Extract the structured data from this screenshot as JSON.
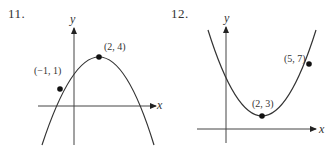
{
  "figures": [
    {
      "number": "11.",
      "axes": {
        "x_label": "x",
        "y_label": "y"
      },
      "curve": "downward-opening parabola",
      "points": [
        {
          "label": "(2, 4)",
          "x": 2,
          "y": 4,
          "role": "vertex"
        },
        {
          "label": "(−1, 1)",
          "x": -1,
          "y": 1,
          "role": "point"
        }
      ]
    },
    {
      "number": "12.",
      "axes": {
        "x_label": "x",
        "y_label": "y"
      },
      "curve": "upward-opening parabola",
      "points": [
        {
          "label": "(2, 3)",
          "x": 2,
          "y": 3,
          "role": "vertex"
        },
        {
          "label": "(5, 7)",
          "x": 5,
          "y": 7,
          "role": "point"
        }
      ]
    }
  ],
  "colors": {
    "line": "#333333",
    "point": "#111111",
    "background": "#ffffff"
  }
}
